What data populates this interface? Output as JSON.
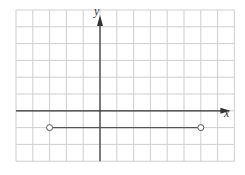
{
  "chart_data": {
    "type": "line",
    "title": "",
    "xlabel": "x",
    "ylabel": "y",
    "xlim": [
      -5,
      8
    ],
    "ylim": [
      -3,
      6
    ],
    "grid": true,
    "series": [
      {
        "name": "y = -1",
        "points": [
          {
            "x": -3,
            "y": -1
          },
          {
            "x": 6,
            "y": -1
          }
        ],
        "endpoints": {
          "left": "open",
          "right": "open"
        }
      }
    ]
  },
  "labels": {
    "x_axis": "x",
    "y_axis": "y"
  },
  "colors": {
    "grid": "#cfcfcf",
    "axis": "#333333",
    "line": "#555555",
    "background": "#ffffff"
  }
}
